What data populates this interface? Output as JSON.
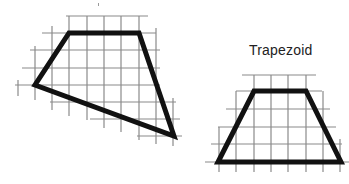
{
  "figures": [
    {
      "id": "quadrilateral",
      "label": "",
      "stroke_color": "#111111",
      "grid_color": "#8a8a8a",
      "vertices": [
        [
          69,
          33
        ],
        [
          139,
          33
        ],
        [
          174,
          136
        ],
        [
          35,
          85
        ]
      ]
    },
    {
      "id": "trapezoid",
      "label": "Trapezoid",
      "stroke_color": "#111111",
      "grid_color": "#8a8a8a",
      "vertices": [
        [
          254,
          91
        ],
        [
          306,
          91
        ],
        [
          341,
          162
        ],
        [
          218,
          162
        ]
      ]
    }
  ],
  "colors": {
    "background": "#ffffff",
    "shape": "#111111",
    "grid": "#8a8a8a"
  }
}
